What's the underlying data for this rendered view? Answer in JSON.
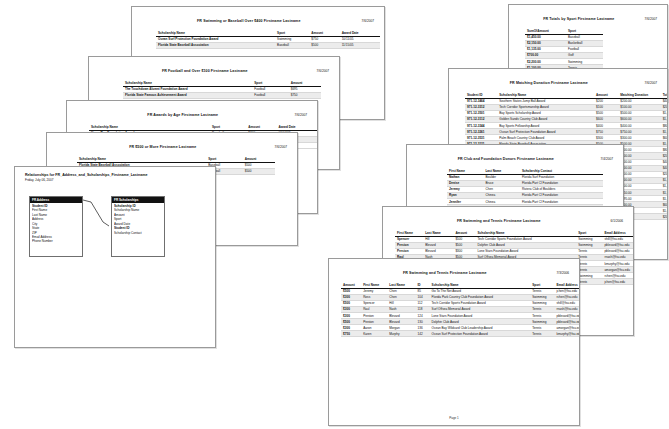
{
  "app": {
    "window_title": "Microsoft Access - Report Print Preview Collage",
    "background_color": "#ffffff",
    "sheet_border_color": "#9a9a9a",
    "header_fill_color": "#111111",
    "row_shade_color": "#ececec"
  },
  "reports": [
    {
      "id": "swimming-baseball-over-400",
      "title": "FR Swimming or Baseball Over $400 Firstname Lastname",
      "date": "7/6/2007",
      "columns": [
        "Scholarship Name",
        "Sport",
        "Amount",
        "Award Date"
      ],
      "rows": [
        [
          "Ocean Surf Protection Foundation Award",
          "Swimming",
          "$750",
          "10/11/05"
        ],
        [
          "Florida State Baseball Association",
          "Baseball",
          "$500",
          "11/15/05"
        ]
      ],
      "footer": ""
    },
    {
      "id": "football-over-100",
      "title": "FR Football and Over $100 Firstname Lastname",
      "date": "7/6/2007",
      "columns": [
        "Scholarship Name",
        "Sport",
        "Amount"
      ],
      "rows": [
        [
          "The Touchdown Alumni Foundation Award",
          "Football",
          "$695"
        ],
        [
          "Florida State Famous Achievement Award",
          "Football",
          "$750"
        ]
      ],
      "footer": ""
    },
    {
      "id": "awards-by-age",
      "title": "FR Awards by Age Firstname Lastname",
      "date": "7/6/2007",
      "columns": [
        "Scholarship Name",
        "Sport",
        "Amount",
        "Award Date"
      ],
      "rows": [
        [
          "Home Run Foundation Award",
          "Baseball",
          "$200",
          "06/04/05"
        ],
        [
          "Bay Town Sports Award",
          "Basketball",
          "$600",
          "09/11/05"
        ],
        [
          "Southern States Jump Ball Award",
          "Basketball",
          "$200",
          "10/11/05"
        ]
      ],
      "footer": ""
    },
    {
      "id": "500-or-more",
      "title": "FR $500 or More Firstname Lastname",
      "date": "7/6/2007",
      "columns": [
        "Scholarship Name",
        "Sport",
        "Amount"
      ],
      "rows": [
        [
          "Florida State Baseball Association",
          "Baseball",
          "$500"
        ],
        [
          "Florida State Baseball Association",
          "Baseball",
          "$500"
        ]
      ],
      "footer": ""
    },
    {
      "id": "sports-by-type",
      "title": "FR Totals by Sport Firstname Lastname",
      "date": "7/6/2007",
      "columns": [
        "SumOfAmount",
        "Sport"
      ],
      "rows": [
        [
          "$1,450.00",
          "Baseball"
        ],
        [
          "$2,150.00",
          "Basketball"
        ],
        [
          "$1,135.00",
          "Football"
        ],
        [
          "$700.00",
          "Golf"
        ],
        [
          "$2,200.00",
          "Swimming"
        ],
        [
          "$1,100.00",
          "Tennis"
        ],
        [
          "$600.00",
          "Volleyball"
        ]
      ],
      "footer": ""
    },
    {
      "id": "matching-donation",
      "title": "FR Matching Donation Firstname Lastname",
      "date": "7/6/2007",
      "columns": [
        "Student ID",
        "Scholarship Name",
        "Amount",
        "Matching Donation",
        "Total Scholarship"
      ],
      "rows": [
        [
          "971-12-3464",
          "Southern States Jump Ball Award",
          "$200",
          "$200.00",
          "$400.00"
        ],
        [
          "971-12-3312",
          "Tech Corridor Sportsmanship Award",
          "$100",
          "$100.00",
          "$200.00"
        ],
        [
          "971-12-3501",
          "Bay Sports Scholarship Award",
          "$500",
          "$500.00",
          "$1,000.00"
        ],
        [
          "971-12-3112",
          "Golden Sands Country Club Award",
          "$600",
          "$600.00",
          "$1,200.00"
        ],
        [
          "971-12-3344",
          "Bay Sports Fellowship Award",
          "$400",
          "$400.00",
          "$800.00"
        ],
        [
          "971-12-3261",
          "Ocean Surf Protection Foundation Award",
          "$750",
          "$750.00",
          "$1,500.00"
        ],
        [
          "971-12-3531",
          "Palm Beach Country Club Award",
          "$300",
          "$300.00",
          "$600.00"
        ],
        [
          "971-12-3121",
          "Florida State Baseball Association",
          "$500",
          "$500.00",
          "$1,000.00"
        ],
        [
          "971-12-3163",
          "Three Bay's Baseball Club Leadership Award",
          "$400",
          "$400.00",
          "$800.00"
        ],
        [
          "971-12-3125",
          "Lone Gardens Ridtree Memorial Award",
          "$100",
          "$100.00",
          "$200.00"
        ],
        [
          "971-12-3185",
          "Southern States Jump Ball Award",
          "$200",
          "$200.00",
          "$400.00"
        ],
        [
          "971-12-3210",
          "Home Run Foundation Award",
          "$200",
          "$200.00",
          "$400.00"
        ],
        [
          "971-12-3222",
          "Tech Corridor Sportsmanship Award",
          "$100",
          "$100.00",
          "$200.00"
        ],
        [
          "971-12-3240",
          "Bay Town Sports Award",
          "$600",
          "$600.00",
          "$1,200.00"
        ],
        [
          "971-12-3276",
          "Golden Sands Country Club Award",
          "$600",
          "$600.00",
          "$1,200.00"
        ],
        [
          "971-12-3288",
          "Florida State Famous Achievement Award",
          "$750",
          "$750.00",
          "$1,500.00"
        ],
        [
          "971-12-3299",
          "The Touchdown Alumni Foundation Award",
          "$695",
          "$695.00",
          "$1,390.00"
        ],
        [
          "971-12-3310",
          "Palm Beach Country Club Award",
          "$300",
          "$300.00",
          "$600.00"
        ],
        [
          "971-12-3322",
          "Bay Sports Scholarship Award",
          "$500",
          "$500.00",
          "$1,000.00"
        ],
        [
          "971-12-3340",
          "Lone Gardens Ridtree Memorial Award",
          "$100",
          "$100.00",
          "$200.00"
        ]
      ],
      "footer": ""
    },
    {
      "id": "club-foundation-donors",
      "title": "FR Club and Foundation Donors Firstname Lastname",
      "date": "7/4/2007",
      "columns": [
        "First Name",
        "Last Name",
        "Scholarship Contact"
      ],
      "rows": [
        [
          "Nathan",
          "Boulder",
          "Florida Surf Foundation"
        ],
        [
          "Denise",
          "Bruce",
          "Florida Part Cl Foundation"
        ],
        [
          "Jeremy",
          "Chen",
          "Riviera Club of Boulders"
        ],
        [
          "Ryan",
          "Chinea",
          "Florida Part Cl Foundation"
        ],
        [
          "Jennifer",
          "Chinea",
          "Florida Part Cl Foundation"
        ],
        [
          "Boyd",
          "Coleman",
          "Florida Part Cl Foundation"
        ],
        [
          "Melody",
          "Gregor",
          "Florida Part Cl Foundation"
        ],
        [
          "Aaron",
          "Godsey",
          "Florida Part Cl Foundation"
        ],
        [
          "Naomi",
          "Hall",
          "Florida Part Country Club"
        ],
        [
          "Denise",
          "Hill",
          "Florida Part Cl Foundation"
        ],
        [
          "Marcus",
          "Hill",
          "Florida Part Cl Foundation"
        ],
        [
          "Patrick",
          "Jones",
          "Florida Part Cl Foundation"
        ]
      ],
      "footer": ""
    },
    {
      "id": "swimming-tennis",
      "title": "FR Swimming and Tennis Firstname Lastname",
      "date": "6/1/2006",
      "columns": [
        "First Name",
        "Last Name",
        "Amount",
        "Scholarship Name",
        "Sport",
        "Email Address",
        "Phone Number"
      ],
      "rows": [
        [
          "Spencer",
          "Hill",
          "$500",
          "Tech Corridor Sports Foundation Award",
          "Swimming",
          "shill@fsu.edu",
          "(813) 555-8641"
        ],
        [
          "Preston",
          "Blevard",
          "$500",
          "Dolphin Club Award",
          "Swimming",
          "pblevard@fsu.edu",
          "(813) 555-9311"
        ],
        [
          "Preston",
          "Blevard",
          "$300",
          "Lone Stars Foundation Award",
          "Tennis",
          "pblevard@fsu.edu",
          "(813) 555-9311"
        ],
        [
          "Raul",
          "Nash",
          "$500",
          "Surf Offsea Memorial Award",
          "Tennis",
          "rnash@fsu.edu",
          "(813) 555-2233"
        ],
        [
          "Karen",
          "Murphy",
          "$750",
          "Ocean Surf Protection Foundation Award",
          "Tennis",
          "kmurphy@fsu.edu",
          "(813) 555-0145"
        ],
        [
          "Aaron",
          "Morgan",
          "$300",
          "Ocean Bay Wildcard Club Leadership Award",
          "Tennis",
          "amorgan@fsu.edu",
          "(813) 555-3311"
        ],
        [
          "Ross",
          "Chen",
          "$300",
          "Florida Park Country Club Foundation Award",
          "Swimming",
          "rchen@fsu.edu",
          "(813) 555-9840"
        ],
        [
          "Jeremy",
          "Chen",
          "$500",
          "Go To The Net Award",
          "Tennis",
          "jchen@fsu.edu",
          "(813) 555-9884"
        ]
      ],
      "footer": ""
    },
    {
      "id": "swimming-tennis-listing",
      "title": "FR Swimming and Tennis Firstname Lastname",
      "date": "7/3/2006",
      "columns": [
        "Amount",
        "First Name",
        "Last Name",
        "ID",
        "Scholarship Name",
        "Sport",
        "Email Address",
        "Phone Number"
      ],
      "rows": [
        [
          "$500",
          "Jeremy",
          "Chen",
          "85",
          "Go To The Net Award",
          "Tennis",
          "jchen@fsu.edu",
          "(813) 555-9884"
        ],
        [
          "$300",
          "Ross",
          "Chen",
          "104",
          "Florida Park Country Club Foundation Award",
          "Swimming",
          "rchen@fsu.edu",
          "(813) 555-9840"
        ],
        [
          "$500",
          "Spencer",
          "Hill",
          "112",
          "Tech Corridor Sports Foundation Award",
          "Swimming",
          "shill@fsu.edu",
          "(813) 555-8641"
        ],
        [
          "$300",
          "Raul",
          "Nash",
          "118",
          "Surf Offsea Memorial Award",
          "Tennis",
          "rnash@fsu.edu",
          "(813) 555-2233"
        ],
        [
          "$300",
          "Preston",
          "Blevard",
          "124",
          "Lone Stars Foundation Award",
          "Tennis",
          "pblevard@fsu.edu",
          "(813) 555-9311"
        ],
        [
          "$500",
          "Preston",
          "Blevard",
          "130",
          "Dolphin Club Award",
          "Swimming",
          "pblevard@fsu.edu",
          "(813) 555-9311"
        ],
        [
          "$300",
          "Aaron",
          "Morgan",
          "136",
          "Ocean Bay Wildcard Club Leadership Award",
          "Tennis",
          "amorgan@fsu.edu",
          "(813) 555-3311"
        ],
        [
          "$750",
          "Karen",
          "Murphy",
          "142",
          "Ocean Surf Protection Foundation Award",
          "Tennis",
          "kmurphy@fsu.edu",
          "(813) 555-0145"
        ]
      ],
      "footer": "Page 1"
    }
  ],
  "relationships": {
    "title": "Relationships for FR_Address_and_Scholarships_Firstname_Lastname",
    "subtitle": "Friday, July 06, 2007",
    "tables": [
      {
        "name": "FR Address",
        "fields": [
          {
            "label": "Student ID",
            "key": true
          },
          {
            "label": "First Name",
            "key": false
          },
          {
            "label": "Last Name",
            "key": false
          },
          {
            "label": "Address",
            "key": false
          },
          {
            "label": "City",
            "key": false
          },
          {
            "label": "State",
            "key": false
          },
          {
            "label": "ZIP",
            "key": false
          },
          {
            "label": "Email Address",
            "key": false
          },
          {
            "label": "Phone Number",
            "key": false
          }
        ]
      },
      {
        "name": "FR Scholarships",
        "fields": [
          {
            "label": "Scholarship ID",
            "key": true
          },
          {
            "label": "Scholarship Name",
            "key": false
          },
          {
            "label": "Amount",
            "key": false
          },
          {
            "label": "Sport",
            "key": false
          },
          {
            "label": "Award Date",
            "key": false
          },
          {
            "label": "Student ID",
            "key": true
          },
          {
            "label": "Scholarship Contact",
            "key": false
          }
        ]
      }
    ]
  }
}
